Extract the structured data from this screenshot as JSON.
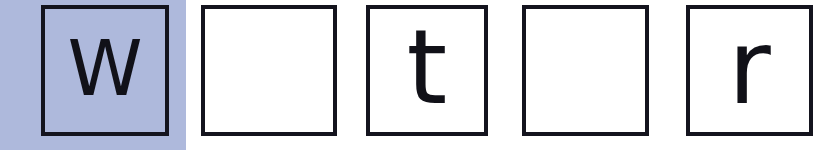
{
  "puzzle": {
    "name": "letter-grid",
    "cell_count": 5,
    "selected_index": 0,
    "highlight_color": "#aeb9dc",
    "border_color": "#14141e",
    "glyph_color": "#111118",
    "background_color": "#ffffff",
    "cells": [
      {
        "index": 1,
        "letter": "W",
        "case": "upper",
        "filled": true,
        "selected": true,
        "left": 41,
        "top": 5,
        "width": 128,
        "height": 131
      },
      {
        "index": 2,
        "letter": "",
        "case": "none",
        "filled": false,
        "selected": false,
        "left": 201,
        "top": 5,
        "width": 136,
        "height": 131
      },
      {
        "index": 3,
        "letter": "t",
        "case": "lower",
        "filled": true,
        "selected": false,
        "left": 366,
        "top": 5,
        "width": 122,
        "height": 131
      },
      {
        "index": 4,
        "letter": "",
        "case": "none",
        "filled": false,
        "selected": false,
        "left": 522,
        "top": 5,
        "width": 127,
        "height": 131
      },
      {
        "index": 5,
        "letter": "r",
        "case": "lower",
        "filled": true,
        "selected": false,
        "left": 686,
        "top": 5,
        "width": 127,
        "height": 131
      }
    ],
    "highlight": {
      "left": 0,
      "width": 186
    }
  }
}
